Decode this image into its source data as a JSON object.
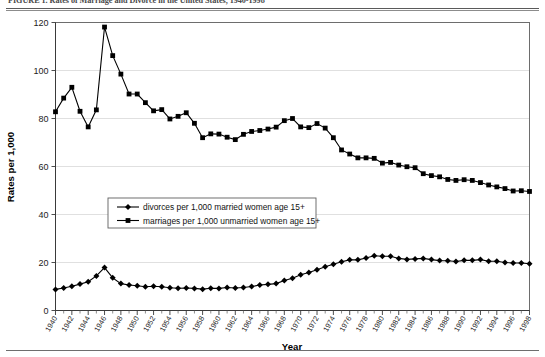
{
  "figure": {
    "caption": "FIGURE 1. Rates of Marriage and Divorce in the United States, 1940-1998"
  },
  "chart_data": {
    "type": "line",
    "title": "",
    "xlabel": "Year",
    "ylabel": "Rates per 1,000",
    "xlim": [
      1940,
      1998
    ],
    "ylim": [
      0,
      120
    ],
    "yticks": [
      0,
      20,
      40,
      60,
      80,
      100,
      120
    ],
    "grid": true,
    "legend_position": "center-left",
    "x": [
      1940,
      1941,
      1942,
      1943,
      1944,
      1945,
      1946,
      1947,
      1948,
      1949,
      1950,
      1951,
      1952,
      1953,
      1954,
      1955,
      1956,
      1957,
      1958,
      1959,
      1960,
      1961,
      1962,
      1963,
      1964,
      1965,
      1966,
      1967,
      1968,
      1969,
      1970,
      1971,
      1972,
      1973,
      1974,
      1975,
      1976,
      1977,
      1978,
      1979,
      1980,
      1981,
      1982,
      1983,
      1984,
      1985,
      1986,
      1987,
      1988,
      1989,
      1990,
      1991,
      1992,
      1993,
      1994,
      1995,
      1996,
      1997,
      1998
    ],
    "xtick_labels": [
      "1940",
      "1942",
      "1944",
      "1946",
      "1948",
      "1950",
      "1952",
      "1954",
      "1956",
      "1958",
      "1960",
      "1962",
      "1964",
      "1966",
      "1968",
      "1970",
      "1972",
      "1974",
      "1976",
      "1978",
      "1980",
      "1982",
      "1984",
      "1986",
      "1988",
      "1990",
      "1992",
      "1994",
      "1996",
      "1998"
    ],
    "series": [
      {
        "name": "marriages per 1,000 unmarried women age 15+",
        "marker": "square",
        "color": "#000000",
        "values": [
          82.8,
          88.5,
          93.0,
          83.0,
          76.5,
          83.6,
          118.1,
          106.2,
          98.5,
          90.2,
          90.2,
          86.6,
          83.2,
          83.7,
          79.8,
          80.9,
          82.4,
          78.0,
          72.0,
          73.6,
          73.5,
          72.2,
          71.2,
          73.4,
          74.6,
          75.0,
          75.6,
          76.4,
          79.1,
          80.0,
          76.5,
          76.2,
          77.9,
          76.0,
          72.0,
          66.9,
          65.2,
          63.6,
          63.6,
          63.4,
          61.4,
          61.7,
          60.6,
          59.9,
          59.5,
          57.0,
          56.2,
          55.7,
          54.6,
          54.2,
          54.5,
          54.2,
          53.3,
          52.3,
          51.5,
          50.8,
          49.8,
          49.9,
          49.6
        ]
      },
      {
        "name": "divorces per 1,000 married women age 15+",
        "marker": "diamond",
        "color": "#000000",
        "values": [
          8.8,
          9.4,
          10.1,
          11.0,
          12.0,
          14.4,
          17.9,
          13.6,
          11.2,
          10.6,
          10.3,
          9.9,
          10.1,
          9.9,
          9.5,
          9.3,
          9.4,
          9.2,
          8.9,
          9.3,
          9.2,
          9.6,
          9.4,
          9.6,
          10.0,
          10.6,
          10.9,
          11.2,
          12.5,
          13.4,
          14.9,
          15.8,
          17.0,
          18.2,
          19.3,
          20.3,
          21.1,
          21.1,
          21.9,
          22.8,
          22.6,
          22.6,
          21.7,
          21.3,
          21.5,
          21.7,
          21.2,
          20.8,
          20.7,
          20.4,
          20.9,
          20.9,
          21.2,
          20.5,
          20.5,
          20.0,
          19.8,
          19.8,
          19.5
        ]
      }
    ]
  }
}
